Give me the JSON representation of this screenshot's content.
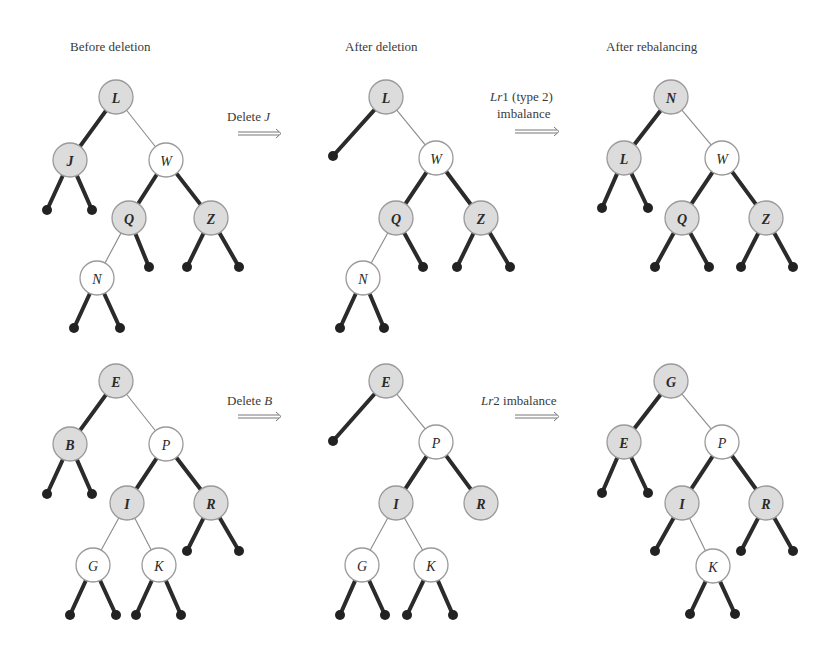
{
  "column_headers": [
    "Before deletion",
    "After deletion",
    "After rebalancing"
  ],
  "rows": [
    {
      "step1_label": "Delete ",
      "step1_key": "J",
      "step2_label_italic": "Lr",
      "step2_label": "1 (type 2)",
      "step2_label_line2": "imbalance",
      "trees": [
        {
          "name": "before-deletion",
          "nodes": [
            {
              "id": "L",
              "x": 116,
              "y": 97,
              "shade": "heavy"
            },
            {
              "id": "J",
              "x": 70,
              "y": 160,
              "shade": "heavy"
            },
            {
              "id": "W",
              "x": 166,
              "y": 160,
              "shade": "light"
            },
            {
              "id": "Q",
              "x": 129,
              "y": 218,
              "shade": "heavy"
            },
            {
              "id": "Z",
              "x": 211,
              "y": 218,
              "shade": "heavy"
            },
            {
              "id": "N",
              "x": 97,
              "y": 278,
              "shade": "light"
            }
          ],
          "edges": [
            [
              "L",
              "J",
              "thick"
            ],
            [
              "L",
              "W",
              "thin"
            ],
            [
              "W",
              "Q",
              "thick"
            ],
            [
              "W",
              "Z",
              "thick"
            ],
            [
              "Q",
              "N",
              "thin"
            ]
          ],
          "leaves": [
            {
              "from": "J",
              "x": 47,
              "y": 210
            },
            {
              "from": "J",
              "x": 92,
              "y": 210
            },
            {
              "from": "Q",
              "x": 149,
              "y": 267
            },
            {
              "from": "Z",
              "x": 187,
              "y": 267
            },
            {
              "from": "Z",
              "x": 239,
              "y": 267
            },
            {
              "from": "N",
              "x": 74,
              "y": 328
            },
            {
              "from": "N",
              "x": 120,
              "y": 328
            }
          ]
        },
        {
          "name": "after-deletion",
          "nodes": [
            {
              "id": "L",
              "x": 386,
              "y": 97,
              "shade": "heavy"
            },
            {
              "id": "W",
              "x": 436,
              "y": 158,
              "shade": "light"
            },
            {
              "id": "Q",
              "x": 396,
              "y": 218,
              "shade": "heavy"
            },
            {
              "id": "Z",
              "x": 481,
              "y": 218,
              "shade": "heavy"
            },
            {
              "id": "N",
              "x": 363,
              "y": 278,
              "shade": "light"
            }
          ],
          "edges": [
            [
              "L",
              "W",
              "thin"
            ],
            [
              "W",
              "Q",
              "thick"
            ],
            [
              "W",
              "Z",
              "thick"
            ],
            [
              "Q",
              "N",
              "thin"
            ]
          ],
          "leaves": [
            {
              "from": "L",
              "x": 333,
              "y": 156
            },
            {
              "from": "Q",
              "x": 423,
              "y": 267
            },
            {
              "from": "Z",
              "x": 457,
              "y": 267
            },
            {
              "from": "Z",
              "x": 510,
              "y": 267
            },
            {
              "from": "N",
              "x": 340,
              "y": 328
            },
            {
              "from": "N",
              "x": 384,
              "y": 328
            }
          ]
        },
        {
          "name": "after-rebalancing",
          "nodes": [
            {
              "id": "N",
              "x": 671,
              "y": 97,
              "shade": "heavy"
            },
            {
              "id": "L",
              "x": 624,
              "y": 158,
              "shade": "heavy"
            },
            {
              "id": "W",
              "x": 722,
              "y": 158,
              "shade": "light"
            },
            {
              "id": "Q",
              "x": 682,
              "y": 218,
              "shade": "heavy"
            },
            {
              "id": "Z",
              "x": 766,
              "y": 218,
              "shade": "heavy"
            }
          ],
          "edges": [
            [
              "N",
              "L",
              "thick"
            ],
            [
              "N",
              "W",
              "thin"
            ],
            [
              "W",
              "Q",
              "thick"
            ],
            [
              "W",
              "Z",
              "thick"
            ]
          ],
          "leaves": [
            {
              "from": "L",
              "x": 602,
              "y": 208
            },
            {
              "from": "L",
              "x": 648,
              "y": 208
            },
            {
              "from": "Q",
              "x": 655,
              "y": 267
            },
            {
              "from": "Q",
              "x": 709,
              "y": 267
            },
            {
              "from": "Z",
              "x": 741,
              "y": 267
            },
            {
              "from": "Z",
              "x": 793,
              "y": 267
            }
          ]
        }
      ]
    },
    {
      "step1_label": "Delete ",
      "step1_key": "B",
      "step2_label_italic": "Lr",
      "step2_label": "2 imbalance",
      "step2_label_line2": "",
      "trees": [
        {
          "name": "before-deletion",
          "nodes": [
            {
              "id": "E",
              "x": 116,
              "y": 381,
              "shade": "heavy"
            },
            {
              "id": "B",
              "x": 70,
              "y": 444,
              "shade": "heavy"
            },
            {
              "id": "P",
              "x": 166,
              "y": 444,
              "shade": "light"
            },
            {
              "id": "I",
              "x": 127,
              "y": 503,
              "shade": "heavy"
            },
            {
              "id": "R",
              "x": 211,
              "y": 503,
              "shade": "heavy"
            },
            {
              "id": "G",
              "x": 93,
              "y": 565,
              "shade": "light"
            },
            {
              "id": "K",
              "x": 159,
              "y": 565,
              "shade": "light"
            }
          ],
          "edges": [
            [
              "E",
              "B",
              "thick"
            ],
            [
              "E",
              "P",
              "thin"
            ],
            [
              "P",
              "I",
              "thick"
            ],
            [
              "P",
              "R",
              "thick"
            ],
            [
              "I",
              "G",
              "thin"
            ],
            [
              "I",
              "K",
              "thin"
            ]
          ],
          "leaves": [
            {
              "from": "B",
              "x": 47,
              "y": 494
            },
            {
              "from": "B",
              "x": 92,
              "y": 494
            },
            {
              "from": "R",
              "x": 187,
              "y": 551
            },
            {
              "from": "R",
              "x": 239,
              "y": 551
            },
            {
              "from": "G",
              "x": 70,
              "y": 615
            },
            {
              "from": "G",
              "x": 116,
              "y": 615
            },
            {
              "from": "K",
              "x": 136,
              "y": 615
            },
            {
              "from": "K",
              "x": 181,
              "y": 615
            }
          ]
        },
        {
          "name": "after-deletion",
          "nodes": [
            {
              "id": "E",
              "x": 386,
              "y": 381,
              "shade": "heavy"
            },
            {
              "id": "P",
              "x": 436,
              "y": 442,
              "shade": "light"
            },
            {
              "id": "I",
              "x": 396,
              "y": 503,
              "shade": "heavy"
            },
            {
              "id": "R",
              "x": 481,
              "y": 503,
              "shade": "heavy"
            },
            {
              "id": "G",
              "x": 362,
              "y": 565,
              "shade": "light"
            },
            {
              "id": "K",
              "x": 431,
              "y": 565,
              "shade": "light"
            }
          ],
          "edges": [
            [
              "E",
              "P",
              "thin"
            ],
            [
              "P",
              "I",
              "thick"
            ],
            [
              "P",
              "R",
              "thick"
            ],
            [
              "I",
              "G",
              "thin"
            ],
            [
              "I",
              "K",
              "thin"
            ]
          ],
          "leaves": [
            {
              "from": "E",
              "x": 333,
              "y": 441
            },
            {
              "from": "G",
              "x": 340,
              "y": 615
            },
            {
              "from": "G",
              "x": 385,
              "y": 615
            },
            {
              "from": "K",
              "x": 407,
              "y": 615
            },
            {
              "from": "K",
              "x": 453,
              "y": 615
            }
          ]
        },
        {
          "name": "after-rebalancing",
          "nodes": [
            {
              "id": "G",
              "x": 671,
              "y": 381,
              "shade": "heavy"
            },
            {
              "id": "E",
              "x": 624,
              "y": 442,
              "shade": "heavy"
            },
            {
              "id": "P",
              "x": 722,
              "y": 442,
              "shade": "light"
            },
            {
              "id": "I",
              "x": 682,
              "y": 503,
              "shade": "heavy"
            },
            {
              "id": "R",
              "x": 766,
              "y": 503,
              "shade": "heavy"
            },
            {
              "id": "K",
              "x": 713,
              "y": 566,
              "shade": "light"
            }
          ],
          "edges": [
            [
              "G",
              "E",
              "thick"
            ],
            [
              "G",
              "P",
              "thin"
            ],
            [
              "P",
              "I",
              "thick"
            ],
            [
              "P",
              "R",
              "thick"
            ],
            [
              "I",
              "K",
              "thin"
            ]
          ],
          "leaves": [
            {
              "from": "E",
              "x": 602,
              "y": 493
            },
            {
              "from": "E",
              "x": 648,
              "y": 493
            },
            {
              "from": "I",
              "x": 655,
              "y": 551
            },
            {
              "from": "R",
              "x": 741,
              "y": 551
            },
            {
              "from": "R",
              "x": 793,
              "y": 551
            },
            {
              "from": "K",
              "x": 690,
              "y": 614
            },
            {
              "from": "K",
              "x": 735,
              "y": 614
            }
          ]
        }
      ]
    }
  ],
  "colors": {
    "heavy_node_fill": "#dcdcdc",
    "light_node_fill": "#ffffff",
    "node_stroke": "#9a9a9a",
    "thick_edge": "#2b2b2b",
    "thin_edge": "#8a8a8a",
    "text": "#3a3a3a"
  }
}
